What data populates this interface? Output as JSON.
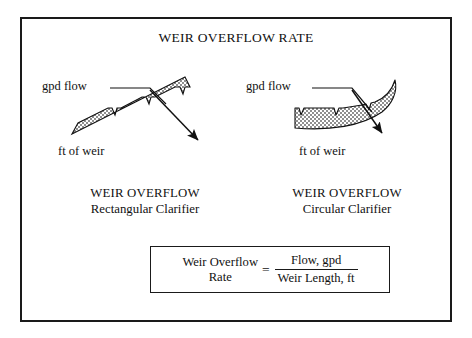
{
  "figure": {
    "title": "WEIR OVERFLOW RATE",
    "background_color": "#ffffff",
    "ink_color": "#1a1a1a",
    "hatch_fill_color": "#9a9a9a"
  },
  "diagrams": [
    {
      "id": "rectangular",
      "flow_label": "gpd flow",
      "base_label": "ft of weir",
      "caption_top": "WEIR OVERFLOW",
      "caption_bottom": "Rectangular Clarifier",
      "weir_shape": "inclined-notched-band",
      "notch_count": 3,
      "arrow_direction": "down-right"
    },
    {
      "id": "circular",
      "flow_label": "gpd flow",
      "base_label": "ft of weir",
      "caption_top": "WEIR OVERFLOW",
      "caption_bottom": "Circular Clarifier",
      "weir_shape": "curved-notched-band",
      "notch_count": 3,
      "arrow_direction": "down-right"
    }
  ],
  "formula": {
    "lhs_line1": "Weir Overflow",
    "lhs_line2": "Rate",
    "equals": "=",
    "numerator": "Flow, gpd",
    "denominator": "Weir Length, ft"
  }
}
